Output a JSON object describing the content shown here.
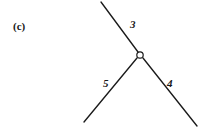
{
  "figure": {
    "panel_label": "(c)",
    "background_color": "#ffffff",
    "stroke_color": "#1a1a1a",
    "text_color": "#181818",
    "width": 198,
    "height": 127,
    "joint": {
      "name": "junction-node",
      "shape": "open-circle",
      "cx": 140,
      "cy": 55,
      "r": 3.2,
      "fill": "#ffffff"
    },
    "branches": [
      {
        "id": "branch-3",
        "label": "3",
        "direction": "upper-left",
        "from": {
          "x": 101,
          "y": 2
        },
        "to": {
          "x": 138,
          "y": 52
        },
        "label_pos": {
          "x": 130,
          "y": 19
        }
      },
      {
        "id": "branch-5",
        "label": "5",
        "direction": "lower-left",
        "from": {
          "x": 137,
          "y": 58
        },
        "to": {
          "x": 84,
          "y": 122
        },
        "label_pos": {
          "x": 103,
          "y": 78
        }
      },
      {
        "id": "branch-4",
        "label": "4",
        "direction": "lower-right",
        "from": {
          "x": 143,
          "y": 58
        },
        "to": {
          "x": 197,
          "y": 126
        },
        "label_pos": {
          "x": 167,
          "y": 78
        }
      }
    ]
  }
}
